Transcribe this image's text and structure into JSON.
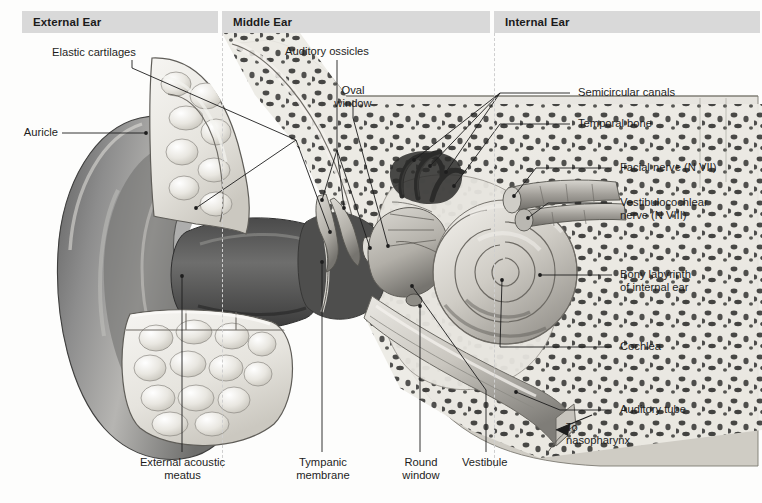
{
  "figure": {
    "kind": "anatomical-illustration",
    "background_color": "#fdfdfc",
    "header_band_color": "#d9d9d9",
    "line_color": "#2a2a2a"
  },
  "regions": [
    {
      "id": "external",
      "label": "External Ear"
    },
    {
      "id": "middle",
      "label": "Middle Ear"
    },
    {
      "id": "internal",
      "label": "Internal Ear"
    }
  ],
  "labels": {
    "elastic_cartilages": "Elastic cartilages",
    "auricle": "Auricle",
    "auditory_ossicles": "Auditory ossicles",
    "oval_window": "Oval\nwindow",
    "semicircular_canals": "Semicircular canals",
    "temporal_bone": "Temporal bone",
    "facial_nerve": "Facial nerve (N VII)",
    "vestibulocochlear_nerve": "Vestibulocochlear\nnerve (N VIII)",
    "bony_labyrinth": "Bony labyrinth\nof internal ear",
    "cochlea": "Cochlea",
    "auditory_tube": "Auditory tube",
    "to_nasopharynx": "To\nnasopharynx",
    "external_acoustic_meatus": "External acoustic\nmeatus",
    "tympanic_membrane": "Tympanic\nmembrane",
    "round_window": "Round\nwindow",
    "vestibule": "Vestibule"
  }
}
